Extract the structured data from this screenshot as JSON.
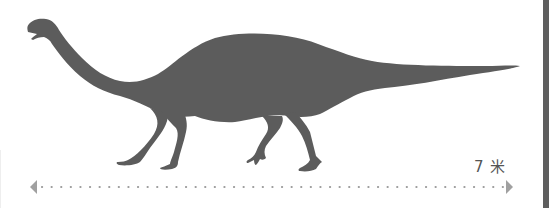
{
  "figure": {
    "silhouette_color": "#5c5c5c",
    "background_color": "#ffffff"
  },
  "scale": {
    "label": "7 米",
    "value": 7,
    "unit": "米",
    "line_color": "#9a9a9a",
    "arrow_color": "#a0a0a0",
    "label_color": "#555555"
  },
  "frame": {
    "right_bar_color": "#5e5e5e"
  }
}
